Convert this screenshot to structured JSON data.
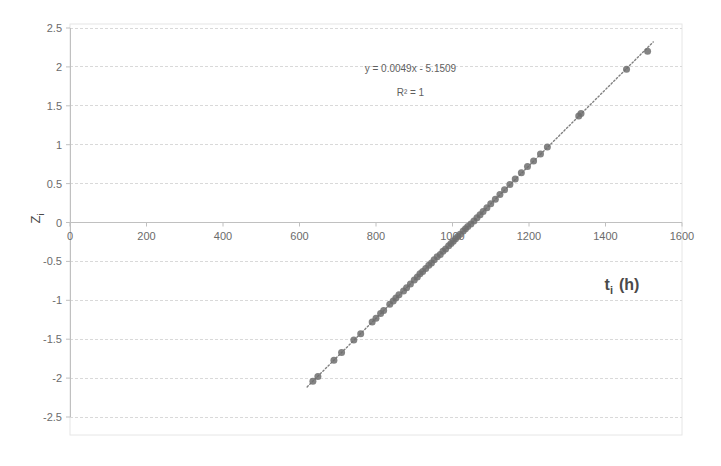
{
  "chart_data": {
    "type": "scatter",
    "title": "",
    "xlabel": "t_i  (h)",
    "xlabel_main": "t",
    "xlabel_sub": "i",
    "xlabel_unit": "(h)",
    "ylabel": "Z_i",
    "ylabel_main": "Z",
    "ylabel_sub": "i",
    "xlim": [
      0,
      1600
    ],
    "ylim": [
      -2.5,
      2.5
    ],
    "xticks": [
      0,
      200,
      400,
      600,
      800,
      1000,
      1200,
      1400,
      1600
    ],
    "xtick_labels": [
      "0",
      "200",
      "400",
      "600",
      "800",
      "1000",
      "1200",
      "1400",
      "1600"
    ],
    "yticks": [
      2.5,
      2,
      1.5,
      1,
      0.5,
      0,
      -0.5,
      -1,
      -1.5,
      -2,
      -2.5
    ],
    "ytick_labels": [
      "2.5",
      "2",
      "1.5",
      "1",
      "0.5",
      "0",
      "-0.5",
      "-1",
      "-1.5",
      "-2",
      "-2.5"
    ],
    "grid": true,
    "grid_axis": "y",
    "legend": false,
    "annotations": [
      {
        "text": "y = 0.0049x - 5.1509",
        "x": 890,
        "y": 1.93
      },
      {
        "text": "R² = 1",
        "x": 890,
        "y": 1.62
      }
    ],
    "trendline": {
      "type": "linear",
      "slope": 0.0049,
      "intercept": -5.1509,
      "r_squared": 1,
      "style": "dotted",
      "color": "#808080",
      "x_start": 620,
      "x_end": 1525
    },
    "series": [
      {
        "name": "Z_i vs t_i",
        "marker": "circle",
        "color": "#6e6e6e",
        "marker_size": 7,
        "x": [
          635,
          648,
          690,
          710,
          742,
          760,
          790,
          800,
          812,
          820,
          836,
          845,
          852,
          860,
          872,
          880,
          890,
          900,
          908,
          915,
          922,
          930,
          938,
          945,
          952,
          960,
          968,
          975,
          982,
          990,
          996,
          1002,
          1008,
          1014,
          1020,
          1028,
          1034,
          1040,
          1048,
          1056,
          1064,
          1072,
          1080,
          1090,
          1100,
          1112,
          1124,
          1136,
          1150,
          1164,
          1180,
          1196,
          1212,
          1230,
          1248,
          1330,
          1336,
          1455,
          1510
        ],
        "y": [
          -2.04,
          -1.98,
          -1.77,
          -1.67,
          -1.51,
          -1.43,
          -1.28,
          -1.23,
          -1.17,
          -1.13,
          -1.05,
          -1.01,
          -0.97,
          -0.93,
          -0.88,
          -0.84,
          -0.79,
          -0.74,
          -0.7,
          -0.66,
          -0.63,
          -0.59,
          -0.55,
          -0.52,
          -0.48,
          -0.44,
          -0.41,
          -0.37,
          -0.34,
          -0.3,
          -0.27,
          -0.24,
          -0.21,
          -0.18,
          -0.15,
          -0.11,
          -0.08,
          -0.05,
          -0.02,
          0.02,
          0.06,
          0.1,
          0.14,
          0.19,
          0.24,
          0.3,
          0.36,
          0.42,
          0.49,
          0.56,
          0.64,
          0.72,
          0.79,
          0.88,
          0.97,
          1.37,
          1.4,
          1.97,
          2.2
        ]
      }
    ],
    "colors": {
      "marker": "#6e6e6e",
      "trendline": "#8c8c8c",
      "gridline": "#d9d9d9",
      "axis": "#c0c0c0",
      "plot_border": "#e6e6e6",
      "text": "#6b6b6b",
      "background": "#ffffff"
    }
  }
}
